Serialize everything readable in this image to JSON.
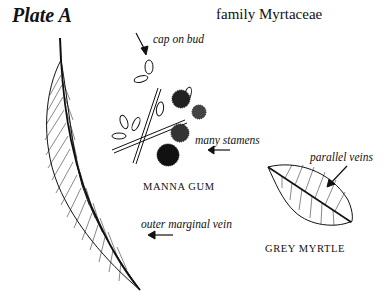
{
  "plate": {
    "title": "Plate A",
    "family": "family Myrtaceae"
  },
  "specimens": [
    {
      "name": "MANNA GUM",
      "annotations": [
        "cap on bud",
        "many stamens",
        "outer marginal vein"
      ]
    },
    {
      "name": "GREY MYRTLE",
      "annotations": [
        "parallel veins"
      ]
    }
  ],
  "labels": {
    "cap_on_bud": "cap on bud",
    "many_stamens": "many stamens",
    "outer_marginal_vein": "outer marginal vein",
    "parallel_veins": "parallel veins",
    "manna_gum": "MANNA GUM",
    "grey_myrtle": "GREY MYRTLE"
  },
  "colors": {
    "ink": "#111111",
    "background": "#ffffff"
  }
}
